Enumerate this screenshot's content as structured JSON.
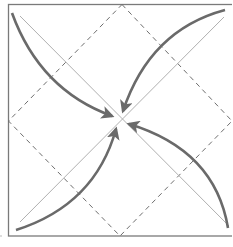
{
  "diagram": {
    "title": "",
    "colors": {
      "background": "#ffffff",
      "border": "#7a7a7a",
      "dashed_fold": "#6e6e6e",
      "diagonal": "#b0b0b0",
      "arrow": "#6a6a6a"
    },
    "elements": [
      {
        "type": "square-outline",
        "name": "paper-square"
      },
      {
        "type": "dashed-diamond",
        "name": "fold-diamond"
      },
      {
        "type": "diagonal-line",
        "name": "diagonal-tl-br"
      },
      {
        "type": "diagonal-line",
        "name": "diagonal-tr-bl"
      },
      {
        "type": "curved-arrow",
        "name": "arrow-top-left",
        "from": "top-left corner",
        "to": "center"
      },
      {
        "type": "curved-arrow",
        "name": "arrow-top-right",
        "from": "top-right corner",
        "to": "center"
      },
      {
        "type": "curved-arrow",
        "name": "arrow-bottom-left",
        "from": "bottom-left corner",
        "to": "center"
      },
      {
        "type": "curved-arrow",
        "name": "arrow-bottom-right",
        "from": "bottom-right corner",
        "to": "center"
      }
    ]
  }
}
